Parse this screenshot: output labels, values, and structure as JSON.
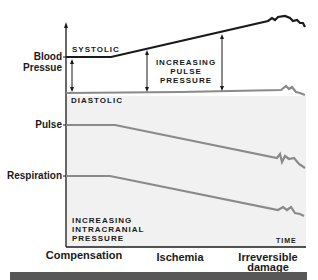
{
  "y_labels": {
    "blood_pressure_line1": "Blood",
    "blood_pressure_line2": "Pressue",
    "pulse": "Pulse",
    "respiration": "Respiration"
  },
  "annotations": {
    "systolic": "SYSTOLIC",
    "diastolic": "DIASTOLIC",
    "pulse_pressure_1": "INCREASING",
    "pulse_pressure_2": "PULSE",
    "pulse_pressure_3": "PRESSURE",
    "icp_1": "INCREASING",
    "icp_2": "INTRACRANIAL",
    "icp_3": "PRESSURE",
    "time": "TIME"
  },
  "phases": {
    "compensation": "Compensation",
    "ischemia": "Ischemia",
    "irreversible_1": "Irreversible",
    "irreversible_2": "damage"
  },
  "colors": {
    "systolic_line": "#1a1a1a",
    "gray_lines": "#8a8a8a",
    "shaded_area": "#f1f1f1",
    "bottom_bar": "#575757"
  }
}
